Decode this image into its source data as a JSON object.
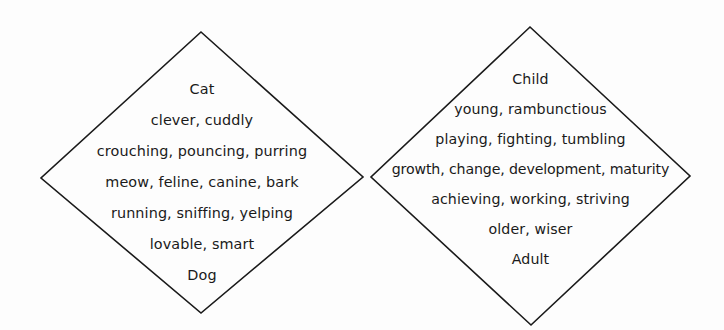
{
  "diagram": {
    "type": "two-diamante-poem-diamonds",
    "background_color": "#fdfdfd",
    "stroke_color": "#1a1a1a",
    "text_color": "#1a1a1a",
    "left_diamond": {
      "name": "cat-dog-diamante",
      "vertices": {
        "top": [
          201,
          32
        ],
        "left": [
          41,
          178
        ],
        "right": [
          363,
          177
        ],
        "bottom": [
          201,
          313
        ]
      },
      "lines": [
        "Cat",
        "clever, cuddly",
        "crouching, pouncing, purring",
        "meow, feline, canine, bark",
        "running, sniffing, yelping",
        "lovable, smart",
        "Dog"
      ]
    },
    "right_diamond": {
      "name": "child-adult-diamante",
      "vertices": {
        "top": [
          530,
          27
        ],
        "left": [
          371,
          177
        ],
        "right": [
          690,
          176
        ],
        "bottom": [
          531,
          325
        ]
      },
      "lines": [
        "Child",
        "young, rambunctious",
        "playing, fighting, tumbling",
        "growth, change, development, maturity",
        "achieving, working, striving",
        "older, wiser",
        "Adult"
      ]
    }
  }
}
